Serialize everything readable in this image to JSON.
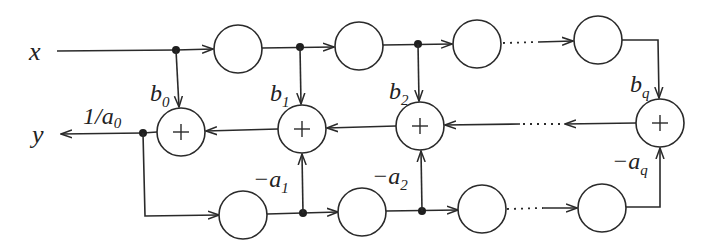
{
  "diagram": {
    "colors": {
      "stroke": "#2a2a2a",
      "junction": "#1e1e1e",
      "background": "#ffffff"
    },
    "input_label": "x",
    "output_label": "y",
    "output_gain": {
      "base": "1/a",
      "sub": "0"
    },
    "feedforward_labels": [
      {
        "base": "b",
        "sub": "0"
      },
      {
        "base": "b",
        "sub": "1"
      },
      {
        "base": "b",
        "sub": "2"
      },
      {
        "base": "b",
        "sub": "q"
      }
    ],
    "feedback_labels": [
      {
        "base": "−a",
        "sub": "1"
      },
      {
        "base": "−a",
        "sub": "2"
      },
      {
        "base": "−a",
        "sub": "q"
      }
    ],
    "adder_symbol": "+",
    "top_delay_count": 4,
    "bottom_delay_count": 4,
    "adder_count": 4,
    "ellipsis": "···"
  }
}
